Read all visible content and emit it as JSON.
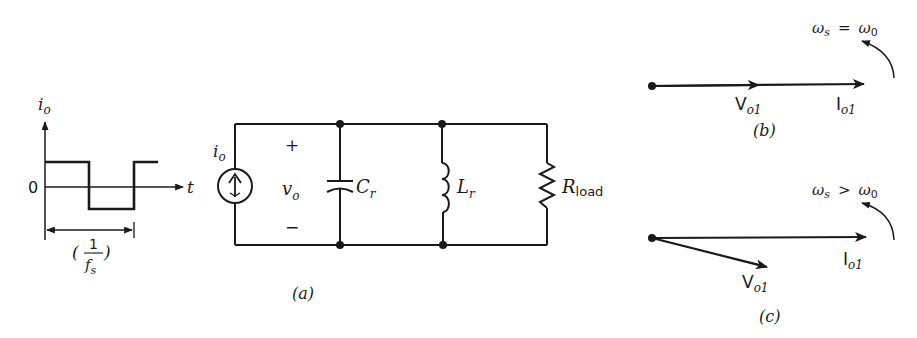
{
  "colors": {
    "ink": "#1a1a1a",
    "background": "#ffffff"
  },
  "waveform": {
    "y_axis_label": "i",
    "y_axis_sub": "o",
    "x_axis_label": "t",
    "zero_label": "0",
    "period_label_num": "1",
    "period_label_den": "f",
    "period_label_den_sub": "s",
    "paren_open": "(",
    "paren_close": ")"
  },
  "circuit": {
    "source_label": "i",
    "source_label_sub": "o",
    "plus": "+",
    "minus": "−",
    "voltage_label": "v",
    "voltage_label_sub": "o",
    "capacitor_label": "C",
    "capacitor_label_sub": "r",
    "inductor_label": "L",
    "inductor_label_sub": "r",
    "resistor_label": "R",
    "resistor_label_sub": "load",
    "caption": "(a)"
  },
  "phasor_b": {
    "condition_left": "ω",
    "condition_left_sub": "s",
    "condition_op": "=",
    "condition_right": "ω",
    "condition_right_sub": "0",
    "v_label": "V",
    "v_label_sub": "o1",
    "i_label": "I",
    "i_label_sub": "o1",
    "caption": "(b)"
  },
  "phasor_c": {
    "condition_left": "ω",
    "condition_left_sub": "s",
    "condition_op": ">",
    "condition_right": "ω",
    "condition_right_sub": "0",
    "v_label": "V",
    "v_label_sub": "o1",
    "i_label": "I",
    "i_label_sub": "o1",
    "caption": "(c)"
  }
}
